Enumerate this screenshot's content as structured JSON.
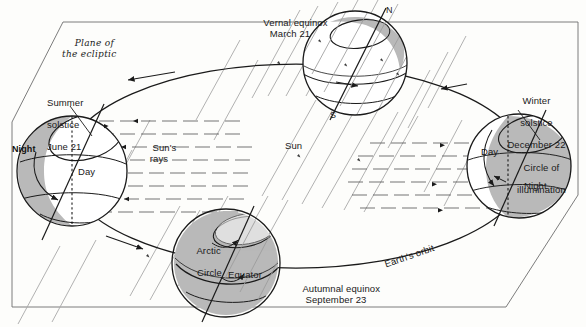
{
  "figure": {
    "type": "astronomy-diagram",
    "background_color": "#fdfdfb",
    "ink_color": "#1a1a1a",
    "shade_color": "#b8b8b8",
    "ray_color": "#9a9a9a"
  },
  "plane": {
    "label_line1": "Plane of",
    "label_line2": "the ecliptic"
  },
  "sun": {
    "label": "Sun",
    "rays_label_line1": "Sun's",
    "rays_label_line2": "rays"
  },
  "orbit": {
    "label": "Earth's orbit",
    "direction": "counterclockwise"
  },
  "positions": [
    {
      "id": "summer-solstice",
      "name_line1": "Summer",
      "name_line2": "solstice",
      "date": "June 21",
      "lit_label": "Day",
      "dark_label": "Night",
      "shaded_side": "left"
    },
    {
      "id": "vernal-equinox",
      "name_line1": "Vernal equinox",
      "name_line2": "",
      "date": "March 21",
      "pole_north": "N",
      "pole_south": "S",
      "shaded_side": "top-right-sliver"
    },
    {
      "id": "winter-solstice",
      "name_line1": "Winter",
      "name_line2": "solstice",
      "date": "December 22",
      "lit_label": "Day",
      "dark_label": "Night",
      "circle_label_line1": "Circle of",
      "circle_label_line2": "illumination",
      "shaded_side": "right"
    },
    {
      "id": "autumnal-equinox",
      "name_line1": "Autumnal equinox",
      "name_line2": "",
      "date": "September 23",
      "arctic_label_line1": "Arctic",
      "arctic_label_line2": "Circle",
      "equator_label": "Equator",
      "shaded_side": "full"
    }
  ]
}
